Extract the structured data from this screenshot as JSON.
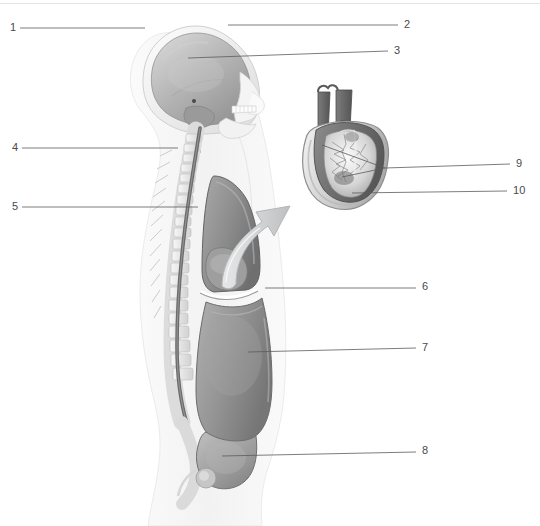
{
  "figure": {
    "type": "anatomical-diagram",
    "background_color": "#ffffff",
    "line_color": "#5c5c5c",
    "label_color": "#4a4a4a"
  },
  "labels": [
    {
      "id": "1",
      "text": "1",
      "side": "left",
      "x": 10,
      "y": 22,
      "line": {
        "x1": 20,
        "y1": 28,
        "x2": 145,
        "y2": 28
      }
    },
    {
      "id": "2",
      "text": "2",
      "side": "right",
      "x": 404,
      "y": 19,
      "line": {
        "x1": 228,
        "y1": 25,
        "x2": 398,
        "y2": 25
      }
    },
    {
      "id": "3",
      "text": "3",
      "side": "right",
      "x": 394,
      "y": 45,
      "line": {
        "x1": 188,
        "y1": 58,
        "x2": 388,
        "y2": 51
      }
    },
    {
      "id": "4",
      "text": "4",
      "side": "left",
      "x": 12,
      "y": 142,
      "line": {
        "x1": 22,
        "y1": 148,
        "x2": 178,
        "y2": 148
      }
    },
    {
      "id": "5",
      "text": "5",
      "side": "left",
      "x": 12,
      "y": 201,
      "line": {
        "x1": 22,
        "y1": 207,
        "x2": 198,
        "y2": 207
      }
    },
    {
      "id": "6",
      "text": "6",
      "side": "right",
      "x": 422,
      "y": 281,
      "line": {
        "x1": 265,
        "y1": 288,
        "x2": 416,
        "y2": 288
      }
    },
    {
      "id": "7",
      "text": "7",
      "side": "right",
      "x": 422,
      "y": 342,
      "line": {
        "x1": 248,
        "y1": 352,
        "x2": 416,
        "y2": 348
      }
    },
    {
      "id": "8",
      "text": "8",
      "side": "right",
      "x": 422,
      "y": 445,
      "line": {
        "x1": 222,
        "y1": 456,
        "x2": 416,
        "y2": 452
      }
    },
    {
      "id": "9",
      "text": "9",
      "side": "right",
      "x": 516,
      "y": 158,
      "line": {
        "x1": 385,
        "y1": 168,
        "x2": 510,
        "y2": 164
      }
    },
    {
      "id": "10",
      "text": "10",
      "side": "right",
      "x": 513,
      "y": 185,
      "line": {
        "x1": 352,
        "y1": 193,
        "x2": 507,
        "y2": 191
      }
    }
  ],
  "callout_branches": [
    {
      "name": "nine-branch-upper",
      "x1": 322,
      "y1": 145,
      "x2": 385,
      "y2": 168
    },
    {
      "name": "nine-branch-lower",
      "x1": 342,
      "y1": 177,
      "x2": 385,
      "y2": 168
    }
  ],
  "arrow": {
    "name": "magnify-arrow",
    "from": "thoracic-cavity",
    "to": "heart-inset",
    "color": "#c9cbcd"
  },
  "inset": {
    "name": "heart-inset",
    "x": 295,
    "y": 88,
    "width": 110,
    "height": 115
  }
}
